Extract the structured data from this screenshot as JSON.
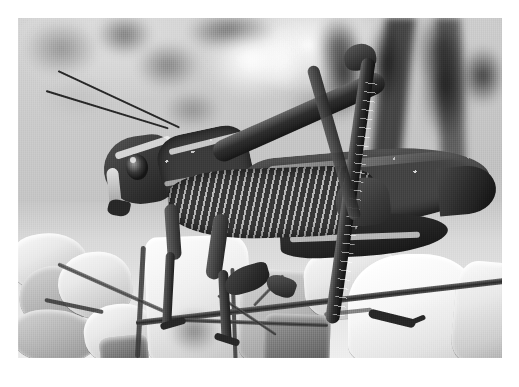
{
  "page": {
    "background_color": "#ffffff",
    "kind": "printed-photograph-plate"
  },
  "photo": {
    "alt_title": "Grasshopper on rocky ground",
    "subject": "grasshopper",
    "orientation": "landscape",
    "color_mode": "black-and-white",
    "frame": {
      "left": 18,
      "top": 18,
      "width": 484,
      "height": 340
    },
    "tones": {
      "highlight": "#f4f4f4",
      "midtone": "#b9b9b9",
      "shadow": "#3c3c3c",
      "deep_shadow": "#1e1e1e"
    },
    "regions": [
      {
        "name": "background-scrub",
        "description": "blurred out-of-focus vegetation and stones"
      },
      {
        "name": "insect-body",
        "description": "grasshopper seen in left-facing profile"
      },
      {
        "name": "rocky-ground",
        "description": "pale angular limestone gravel in foreground"
      },
      {
        "name": "twig",
        "description": "dry twig crossing the lower foreground diagonally"
      }
    ],
    "insect_parts": [
      "antenna-left",
      "antenna-right",
      "head",
      "compound-eye",
      "pronotum",
      "forewing",
      "hind-femur",
      "hind-tibia",
      "hind-tarsus",
      "foreleg",
      "midleg",
      "abdomen"
    ]
  }
}
